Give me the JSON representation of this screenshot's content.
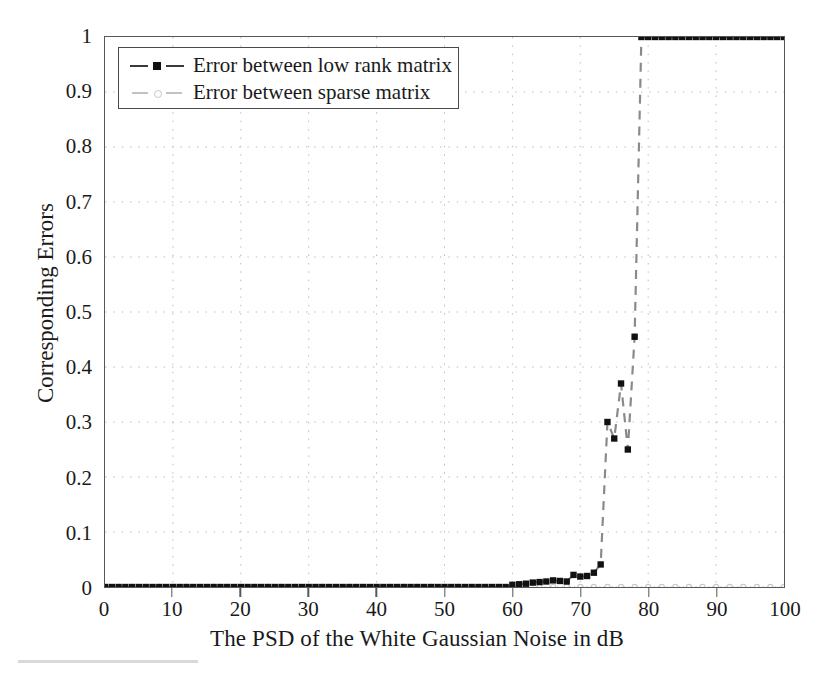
{
  "chart_data": {
    "type": "line",
    "title": "",
    "xlabel": "The PSD of the White Gaussian Noise in dB",
    "ylabel": "Corresponding Errors",
    "xlim": [
      0,
      100
    ],
    "ylim": [
      0,
      1
    ],
    "xticks": [
      "0",
      "10",
      "20",
      "30",
      "40",
      "50",
      "60",
      "70",
      "80",
      "90",
      "100"
    ],
    "yticks": [
      "0",
      "0.1",
      "0.2",
      "0.3",
      "0.4",
      "0.5",
      "0.6",
      "0.7",
      "0.8",
      "0.9",
      "1"
    ],
    "xtick_values": [
      0,
      10,
      20,
      30,
      40,
      50,
      60,
      70,
      80,
      90,
      100
    ],
    "ytick_values": [
      0,
      0.1,
      0.2,
      0.3,
      0.4,
      0.5,
      0.6,
      0.7,
      0.8,
      0.9,
      1
    ],
    "grid": true,
    "grid_style": "dotted",
    "legend_position": "upper-left-inside",
    "series": [
      {
        "name": "Error between low rank matrix",
        "color": "#1a1a1a",
        "line_style": "dashed",
        "marker": "square-filled",
        "x": [
          0,
          1,
          2,
          3,
          4,
          5,
          6,
          7,
          8,
          9,
          10,
          11,
          12,
          13,
          14,
          15,
          16,
          17,
          18,
          19,
          20,
          21,
          22,
          23,
          24,
          25,
          26,
          27,
          28,
          29,
          30,
          31,
          32,
          33,
          34,
          35,
          36,
          37,
          38,
          39,
          40,
          41,
          42,
          43,
          44,
          45,
          46,
          47,
          48,
          49,
          50,
          51,
          52,
          53,
          54,
          55,
          56,
          57,
          58,
          59,
          60,
          61,
          62,
          63,
          64,
          65,
          66,
          67,
          68,
          69,
          70,
          71,
          72,
          73,
          74,
          75,
          76,
          77,
          78,
          79,
          80,
          81,
          82,
          83,
          84,
          85,
          86,
          87,
          88,
          89,
          90,
          91,
          92,
          93,
          94,
          95,
          96,
          97,
          98,
          99,
          100
        ],
        "y": [
          0,
          0,
          0,
          0,
          0,
          0,
          0,
          0,
          0,
          0,
          0,
          0,
          0,
          0,
          0,
          0,
          0,
          0,
          0,
          0,
          0,
          0,
          0,
          0,
          0,
          0,
          0,
          0,
          0,
          0,
          0,
          0,
          0,
          0,
          0,
          0,
          0,
          0,
          0,
          0,
          0,
          0,
          0,
          0,
          0,
          0,
          0,
          0,
          0,
          0,
          0,
          0,
          0,
          0,
          0,
          0,
          0,
          0,
          0,
          0,
          0.004,
          0.005,
          0.006,
          0.008,
          0.009,
          0.01,
          0.012,
          0.011,
          0.01,
          0.022,
          0.019,
          0.02,
          0.026,
          0.041,
          0.3,
          0.27,
          0.37,
          0.25,
          0.455,
          1.0,
          1.0,
          1.0,
          1.0,
          1.0,
          1.0,
          1.0,
          1.0,
          1.0,
          1.0,
          1.0,
          1.0,
          1.0,
          1.0,
          1.0,
          1.0,
          1.0,
          1.0,
          1.0,
          1.0,
          1.0,
          1.0
        ]
      },
      {
        "name": "Error between sparse matrix",
        "color": "#c9c9c9",
        "line_style": "dotted",
        "marker": "circle-open",
        "x": [
          0,
          2,
          4,
          6,
          8,
          10,
          12,
          14,
          16,
          18,
          20,
          22,
          24,
          26,
          28,
          30,
          32,
          34,
          36,
          38,
          40,
          42,
          44,
          46,
          48,
          50,
          52,
          54,
          56,
          58,
          60,
          62,
          64,
          66,
          68,
          70,
          72,
          74,
          76,
          78,
          80,
          82,
          84,
          86,
          88,
          90,
          92,
          94,
          96,
          98,
          100
        ],
        "y": [
          0,
          0,
          0,
          0,
          0,
          0,
          0,
          0,
          0,
          0,
          0,
          0,
          0,
          0,
          0,
          0,
          0,
          0,
          0,
          0,
          0,
          0,
          0,
          0,
          0,
          0,
          0,
          0,
          0,
          0,
          0,
          0,
          0,
          0,
          0,
          0,
          0,
          0,
          0,
          0,
          0,
          0,
          0,
          0,
          0,
          0,
          0,
          0,
          0,
          0,
          0
        ]
      }
    ],
    "annotations": [
      "Low-rank error stays near 0 until about 63 dB, rises sharply between 70 and 79 dB, and saturates at 1 from about 79 dB onward.",
      "Sparse-matrix error remains at 0 across the whole PSD range."
    ]
  },
  "legend": {
    "entries": [
      {
        "label": "Error between low rank matrix"
      },
      {
        "label": "Error between sparse matrix"
      }
    ]
  },
  "axes": {
    "x_title": "The PSD of the White Gaussian Noise in dB",
    "y_title": "Corresponding Errors"
  }
}
